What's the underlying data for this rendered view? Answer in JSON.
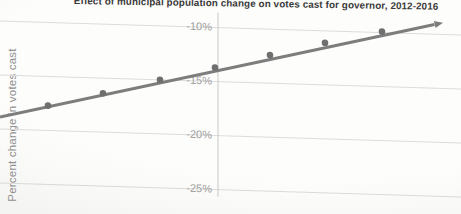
{
  "header": {
    "title": "Effect of municipal population change on votes cast for governor, 2012-2016"
  },
  "axes": {
    "y_label": "Percent change in votes cast",
    "y_tick_labels": [
      "-10%",
      "-15%",
      "-20%",
      "-25%"
    ]
  },
  "colors": {
    "title_text": "#3a3a3a",
    "tick_text": "#9d9d9d",
    "axis_label_text": "#8f8f8f",
    "gridline": "#dcdcdc",
    "zero_axis_line": "#c9c9c9",
    "trend_line": "#7d7d7d",
    "data_point": "#6f6f6f"
  },
  "chart_data": {
    "type": "scatter",
    "title": "Effect of municipal population change on votes cast for governor, 2012-2016",
    "xlabel": "",
    "ylabel": "Percent change in votes cast",
    "y_ticks_percent": [
      -10,
      -15,
      -20,
      -25
    ],
    "ylim_visible": [
      -27,
      -8
    ],
    "grid": true,
    "legend": false,
    "vertical_zero_axis": true,
    "x_tick_labels_visible": false,
    "points": [
      {
        "x_px": 48,
        "y_percent": -17.7
      },
      {
        "x_px": 103,
        "y_percent": -16.4
      },
      {
        "x_px": 160,
        "y_percent": -15.0
      },
      {
        "x_px": 215,
        "y_percent": -13.7
      },
      {
        "x_px": 270,
        "y_percent": -12.4
      },
      {
        "x_px": 325,
        "y_percent": -11.1
      },
      {
        "x_px": 382,
        "y_percent": -9.9
      }
    ],
    "trend_line": {
      "direction": "increasing",
      "arrow_at_end": true,
      "y_percent_at_left_edge": -18.9,
      "y_percent_at_right_edge": -8.5
    }
  }
}
